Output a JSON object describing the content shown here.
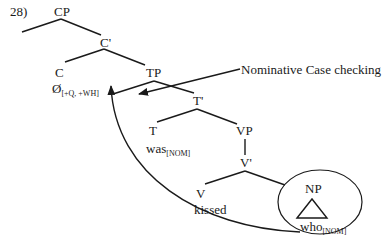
{
  "example_number": "28)",
  "tree": {
    "nodes": {
      "CP": "CP",
      "C_bar": "C'",
      "C": "C",
      "C_head": "Ø",
      "C_head_features": "[+Q, +WH]",
      "TP": "TP",
      "T_bar": "T'",
      "T": "T",
      "T_head": "was",
      "T_head_features": "[NOM]",
      "VP": "VP",
      "V_bar": "V'",
      "V": "V",
      "V_head": "kissed",
      "NP": "NP",
      "NP_head": "who",
      "NP_head_features": "[NOM]"
    }
  },
  "annotations": {
    "case_checking_label": "Nominative Case checking"
  },
  "colors": {
    "line": "#1a1a1a",
    "background": "#ffffff"
  }
}
